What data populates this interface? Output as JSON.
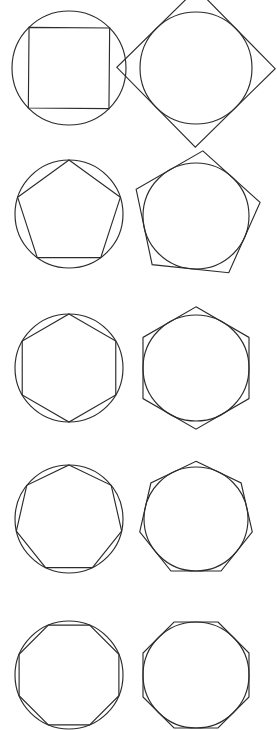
{
  "document": {
    "title": "Inscribed and circumscribed regular polygons",
    "background_color": "#ffffff",
    "stroke_color": "#2b2b2b",
    "stroke_width": 1.15,
    "width": 277,
    "height": 730,
    "columns": [
      {
        "key": "inscribed",
        "label": "Polygon inscribed in circle"
      },
      {
        "key": "circumscribed",
        "label": "Polygon circumscribed about circle"
      }
    ]
  },
  "chart_data": {
    "type": "diagram",
    "xlabel": "",
    "ylabel": "",
    "grid": false,
    "legend": "none",
    "rows": [
      {
        "row_index": 0,
        "sides": 4,
        "polygon_name": "square",
        "left": {
          "relation": "inscribed",
          "circle": {
            "cx": 69,
            "cy": 68,
            "r": 57
          },
          "polygon": {
            "sides": 4,
            "circumradius": 57,
            "rotation_deg": 45.5,
            "center_x": 69,
            "center_y": 68
          }
        },
        "right": {
          "relation": "circumscribed",
          "circle": {
            "cx": 196,
            "cy": 68,
            "r": 56
          },
          "polygon": {
            "sides": 4,
            "inradius": 56,
            "rotation_deg": 0.5,
            "center_x": 196,
            "center_y": 68
          }
        }
      },
      {
        "row_index": 1,
        "sides": 5,
        "polygon_name": "pentagon",
        "left": {
          "relation": "inscribed",
          "circle": {
            "cx": 69,
            "cy": 214,
            "r": 54
          },
          "polygon": {
            "sides": 5,
            "circumradius": 54,
            "rotation_deg": 0,
            "center_x": 69,
            "center_y": 214
          }
        },
        "right": {
          "relation": "circumscribed",
          "circle": {
            "cx": 196,
            "cy": 216,
            "r": 53
          },
          "polygon": {
            "sides": 5,
            "inradius": 53,
            "rotation_deg": 6,
            "center_x": 196,
            "center_y": 216
          }
        }
      },
      {
        "row_index": 2,
        "sides": 6,
        "polygon_name": "hexagon",
        "left": {
          "relation": "inscribed",
          "circle": {
            "cx": 69,
            "cy": 368,
            "r": 54
          },
          "polygon": {
            "sides": 6,
            "circumradius": 54,
            "rotation_deg": 0,
            "center_x": 69,
            "center_y": 368
          }
        },
        "right": {
          "relation": "circumscribed",
          "circle": {
            "cx": 196,
            "cy": 368,
            "r": 53
          },
          "polygon": {
            "sides": 6,
            "inradius": 53,
            "rotation_deg": 0,
            "center_x": 196,
            "center_y": 368
          }
        }
      },
      {
        "row_index": 3,
        "sides": 7,
        "polygon_name": "heptagon",
        "left": {
          "relation": "inscribed",
          "circle": {
            "cx": 69,
            "cy": 519,
            "r": 54
          },
          "polygon": {
            "sides": 7,
            "circumradius": 54,
            "rotation_deg": 0,
            "center_x": 69,
            "center_y": 519
          }
        },
        "right": {
          "relation": "circumscribed",
          "circle": {
            "cx": 196,
            "cy": 519,
            "r": 52
          },
          "polygon": {
            "sides": 7,
            "inradius": 52,
            "rotation_deg": 0,
            "center_x": 196,
            "center_y": 519
          }
        }
      },
      {
        "row_index": 4,
        "sides": 8,
        "polygon_name": "octagon",
        "left": {
          "relation": "inscribed",
          "circle": {
            "cx": 69,
            "cy": 675,
            "r": 54
          },
          "polygon": {
            "sides": 8,
            "circumradius": 54,
            "rotation_deg": 22.5,
            "center_x": 69,
            "center_y": 675
          }
        },
        "right": {
          "relation": "circumscribed",
          "circle": {
            "cx": 196,
            "cy": 675,
            "r": 53
          },
          "polygon": {
            "sides": 8,
            "inradius": 53,
            "rotation_deg": 22.5,
            "center_x": 196,
            "center_y": 675
          }
        }
      }
    ]
  }
}
